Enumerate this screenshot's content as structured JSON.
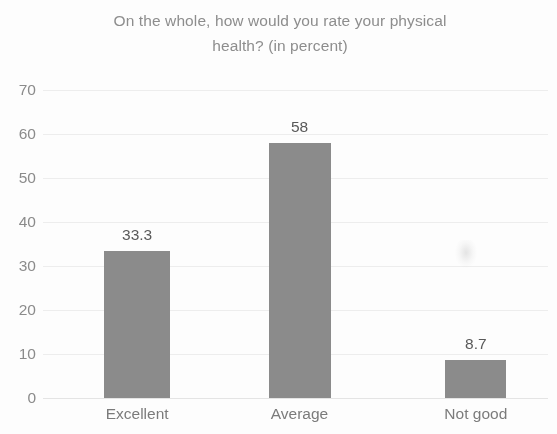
{
  "chart_data": {
    "type": "bar",
    "title": "On the whole, how would you rate your physical health? (in percent)",
    "title_line1": "On the whole, how would you rate your physical",
    "title_line2": "health? (in percent)",
    "xlabel": "",
    "ylabel": "",
    "categories": [
      "Excellent",
      "Average",
      "Not good"
    ],
    "values": [
      33.3,
      58,
      8.7
    ],
    "value_labels": [
      "33.3",
      "58",
      "8.7"
    ],
    "ylim": [
      0,
      70
    ],
    "ytick_values": [
      70,
      60,
      50,
      40,
      30,
      20,
      10,
      0
    ],
    "ytick_labels": [
      "70",
      "60",
      "50",
      "40",
      "30",
      "20",
      "10",
      "0"
    ],
    "grid": true,
    "legend": false,
    "bar_color": "#8b8b8b",
    "title_color": "#8d8d8d",
    "tick_color": "#8b8b8b",
    "gridline_color": "#ededed",
    "background_color": "#fdfdfd"
  }
}
